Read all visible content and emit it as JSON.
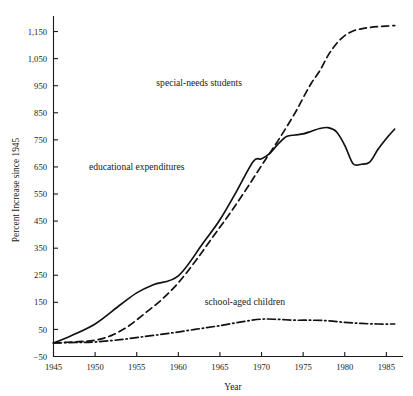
{
  "chart_data": {
    "type": "line",
    "title": "",
    "xlabel": "Year",
    "ylabel": "Percent Increase since 1945",
    "xlim": [
      1945,
      1987
    ],
    "ylim": [
      -50,
      1200
    ],
    "grid": false,
    "legend_position": "inline-annotations",
    "x_ticks": [
      1945,
      1950,
      1955,
      1960,
      1965,
      1970,
      1975,
      1980,
      1985
    ],
    "x_tick_labels": [
      "1945",
      "1950",
      "1955",
      "1960",
      "1965",
      "1970",
      "1975",
      "1980",
      "1985"
    ],
    "y_ticks": [
      -50,
      50,
      150,
      250,
      350,
      450,
      550,
      650,
      750,
      850,
      950,
      1050,
      1150
    ],
    "y_tick_labels": [
      "-50",
      "50",
      "150",
      "250",
      "350",
      "450",
      "550",
      "650",
      "750",
      "850",
      "950",
      "1,050",
      "1,150"
    ],
    "series": [
      {
        "name": "educational expenditures",
        "style": "solid",
        "label_x": 1955.0,
        "label_y": 640,
        "x": [
          1945,
          1947,
          1950,
          1953,
          1955,
          1957,
          1960,
          1963,
          1965,
          1967,
          1969,
          1970,
          1971,
          1972,
          1973,
          1974,
          1975,
          1976,
          1977,
          1978,
          1979,
          1980,
          1981,
          1982,
          1983,
          1984,
          1985,
          1986
        ],
        "values": [
          0,
          25,
          70,
          140,
          185,
          215,
          248,
          370,
          455,
          560,
          670,
          680,
          700,
          735,
          762,
          768,
          772,
          782,
          792,
          795,
          780,
          730,
          662,
          660,
          668,
          715,
          755,
          790
        ]
      },
      {
        "name": "special-needs students",
        "style": "dashed",
        "label_x": 1962.5,
        "label_y": 950,
        "x": [
          1945,
          1948,
          1950,
          1952,
          1954,
          1956,
          1958,
          1960,
          1962,
          1964,
          1966,
          1968,
          1970,
          1972,
          1974,
          1975,
          1976,
          1977,
          1978,
          1979,
          1980,
          1981,
          1982,
          1983,
          1984,
          1985,
          1986
        ],
        "values": [
          0,
          5,
          10,
          28,
          62,
          110,
          160,
          222,
          300,
          385,
          470,
          560,
          655,
          748,
          848,
          905,
          960,
          1005,
          1062,
          1105,
          1135,
          1152,
          1160,
          1165,
          1168,
          1170,
          1172
        ]
      },
      {
        "name": "school-aged children",
        "style": "dash-dot",
        "label_x": 1968.0,
        "label_y": 140,
        "x": [
          1945,
          1948,
          1950,
          1953,
          1956,
          1959,
          1962,
          1965,
          1968,
          1970,
          1972,
          1974,
          1976,
          1978,
          1980,
          1982,
          1984,
          1986
        ],
        "values": [
          0,
          2,
          4,
          12,
          24,
          36,
          50,
          64,
          80,
          88,
          87,
          84,
          84,
          82,
          76,
          72,
          70,
          70
        ]
      }
    ]
  },
  "figure": {
    "background_color": "#ffffff",
    "ink_color": "#111111"
  }
}
